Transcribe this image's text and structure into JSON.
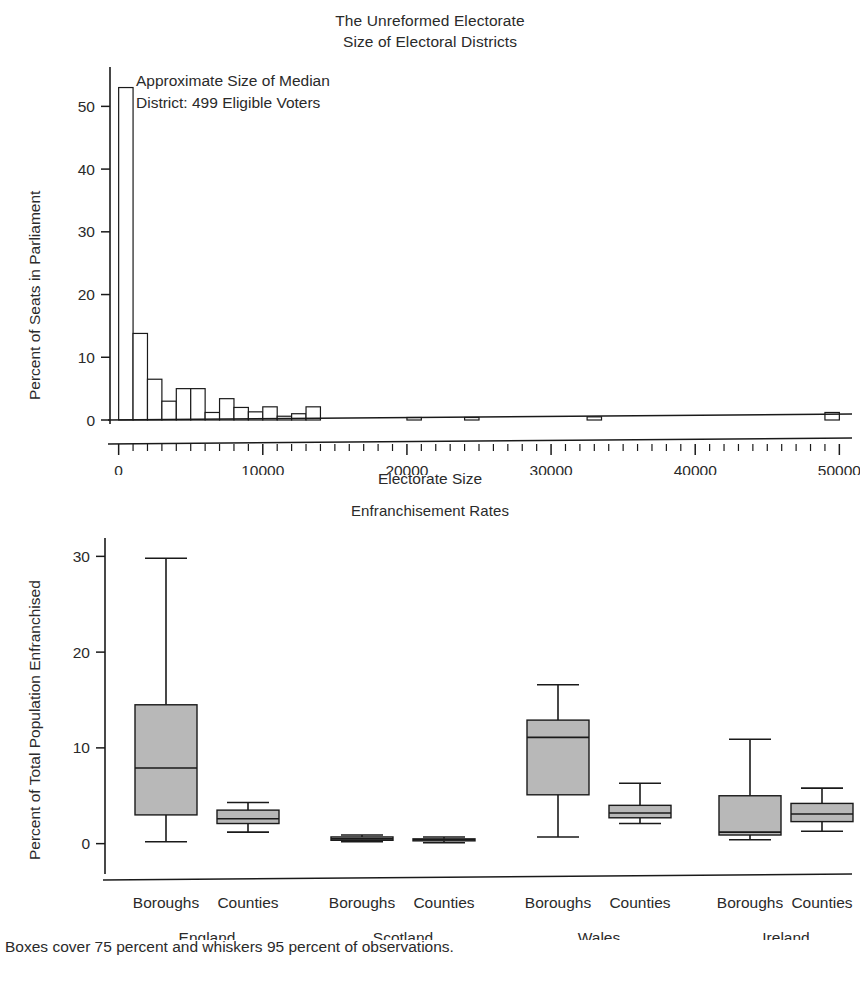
{
  "figure": {
    "title_line1": "The Unreformed Electorate",
    "title_line2": "Size of Electoral Districts",
    "footnote": "Boxes cover 75 percent and whiskers 95 percent of observations."
  },
  "annotation": {
    "line1": "Approximate Size of Median",
    "line2": "District: 499 Eligible Voters"
  },
  "colors": {
    "ink": "#1a1a1a",
    "box_fill": "#b8b8b8",
    "bar_fill": "#ffffff",
    "background": "#ffffff"
  },
  "chart_data": [
    {
      "type": "bar",
      "name": "electoral-district-size-histogram",
      "title": "The Unreformed Electorate / Size of Electoral Districts",
      "xlabel": "Electorate Size",
      "ylabel": "Percent of Seats in Parliament",
      "xlim": [
        -600,
        50600
      ],
      "ylim": [
        0,
        55
      ],
      "xticks": [
        0,
        10000,
        20000,
        30000,
        40000,
        50000
      ],
      "xtick_labels": [
        "0",
        "10000",
        "20000",
        "30000",
        "40000",
        "50000"
      ],
      "x_minor_tick_step": 1000,
      "yticks": [
        0,
        10,
        20,
        30,
        40,
        50
      ],
      "ytick_labels": [
        "0",
        "10",
        "20",
        "30",
        "40",
        "50"
      ],
      "grid": false,
      "legend": "none",
      "bin_width": 1000,
      "annotation": "Approximate Size of Median District: 499 Eligible Voters",
      "bins": [
        {
          "x0": 0,
          "x1": 1000,
          "value": 53.0
        },
        {
          "x0": 1000,
          "x1": 2000,
          "value": 13.8
        },
        {
          "x0": 2000,
          "x1": 3000,
          "value": 6.5
        },
        {
          "x0": 3000,
          "x1": 4000,
          "value": 3.0
        },
        {
          "x0": 4000,
          "x1": 5000,
          "value": 5.0
        },
        {
          "x0": 5000,
          "x1": 6000,
          "value": 5.0
        },
        {
          "x0": 6000,
          "x1": 7000,
          "value": 1.2
        },
        {
          "x0": 7000,
          "x1": 8000,
          "value": 3.4
        },
        {
          "x0": 8000,
          "x1": 9000,
          "value": 2.0
        },
        {
          "x0": 9000,
          "x1": 10000,
          "value": 1.3
        },
        {
          "x0": 10000,
          "x1": 11000,
          "value": 2.1
        },
        {
          "x0": 11000,
          "x1": 12000,
          "value": 0.6
        },
        {
          "x0": 12000,
          "x1": 13000,
          "value": 1.0
        },
        {
          "x0": 13000,
          "x1": 14000,
          "value": 2.1
        },
        {
          "x0": 20000,
          "x1": 21000,
          "value": 0.4
        },
        {
          "x0": 24000,
          "x1": 25000,
          "value": 0.4
        },
        {
          "x0": 32500,
          "x1": 33500,
          "value": 0.5
        },
        {
          "x0": 49000,
          "x1": 50000,
          "value": 1.2
        }
      ]
    },
    {
      "type": "box",
      "name": "enfranchisement-rates-boxplot",
      "title": "Enfranchisement Rates",
      "xlabel": "",
      "ylabel": "Percent of Total Population Enfranchised",
      "ylim": [
        -1.5,
        31.5
      ],
      "yticks": [
        0,
        10,
        20,
        30
      ],
      "ytick_labels": [
        "0",
        "10",
        "20",
        "30"
      ],
      "grid": false,
      "legend": "none",
      "group_labels": [
        "England",
        "Scotland",
        "Wales",
        "Ireland"
      ],
      "category_labels": [
        "Boroughs",
        "Counties",
        "Boroughs",
        "Counties",
        "Boroughs",
        "Counties",
        "Boroughs",
        "Counties"
      ],
      "boxes": [
        {
          "group": "England",
          "category": "Boroughs",
          "whisker_low": 0.2,
          "q1": 3.0,
          "median": 7.9,
          "q3": 14.5,
          "whisker_high": 29.8
        },
        {
          "group": "England",
          "category": "Counties",
          "whisker_low": 1.2,
          "q1": 2.1,
          "median": 2.6,
          "q3": 3.5,
          "whisker_high": 4.3
        },
        {
          "group": "Scotland",
          "category": "Boroughs",
          "whisker_low": 0.2,
          "q1": 0.35,
          "median": 0.5,
          "q3": 0.7,
          "whisker_high": 0.9
        },
        {
          "group": "Scotland",
          "category": "Counties",
          "whisker_low": 0.1,
          "q1": 0.3,
          "median": 0.4,
          "q3": 0.5,
          "whisker_high": 0.7
        },
        {
          "group": "Wales",
          "category": "Boroughs",
          "whisker_low": 0.7,
          "q1": 5.1,
          "median": 11.1,
          "q3": 12.9,
          "whisker_high": 16.6
        },
        {
          "group": "Wales",
          "category": "Counties",
          "whisker_low": 2.1,
          "q1": 2.7,
          "median": 3.2,
          "q3": 4.0,
          "whisker_high": 6.3
        },
        {
          "group": "Ireland",
          "category": "Boroughs",
          "whisker_low": 0.4,
          "q1": 0.9,
          "median": 1.2,
          "q3": 5.0,
          "whisker_high": 10.9
        },
        {
          "group": "Ireland",
          "category": "Counties",
          "whisker_low": 1.3,
          "q1": 2.3,
          "median": 3.1,
          "q3": 4.2,
          "whisker_high": 5.8
        }
      ]
    }
  ]
}
